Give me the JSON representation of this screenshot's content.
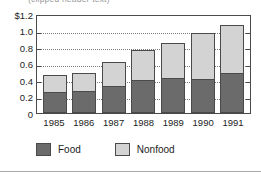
{
  "title": {
    "text": "(clipped header text)"
  },
  "colors": {
    "food": "#6b6b6b",
    "nonfood": "#d3d3d3",
    "axis": "#4a4a4a",
    "grid": "#7a7a7a",
    "text": "#1c1c1c",
    "background": "#ffffff"
  },
  "chart_data": {
    "type": "bar",
    "stacked": true,
    "title": "",
    "xlabel": "",
    "ylabel": "",
    "ylim": [
      0,
      1.2
    ],
    "yticks": [
      0,
      0.2,
      0.4,
      0.6,
      0.8,
      1.0,
      1.2
    ],
    "ytick_labels": [
      "0",
      "0.2",
      "0.4",
      "0.6",
      "0.8",
      "1.0",
      "$1.2"
    ],
    "grid": true,
    "legend_position": "bottom-left",
    "categories": [
      "1985",
      "1986",
      "1987",
      "1988",
      "1989",
      "1990",
      "1991"
    ],
    "series": [
      {
        "name": "Food",
        "color": "#6b6b6b",
        "values": [
          0.25,
          0.27,
          0.33,
          0.4,
          0.43,
          0.41,
          0.48
        ]
      },
      {
        "name": "Nonfood",
        "color": "#d3d3d3",
        "values": [
          0.21,
          0.22,
          0.29,
          0.36,
          0.42,
          0.56,
          0.59
        ]
      }
    ],
    "totals": [
      0.46,
      0.49,
      0.62,
      0.76,
      0.85,
      0.97,
      1.07
    ]
  },
  "legend": {
    "items": [
      {
        "label": "Food",
        "swatch": "food"
      },
      {
        "label": "Nonfood",
        "swatch": "nonfood"
      }
    ]
  }
}
